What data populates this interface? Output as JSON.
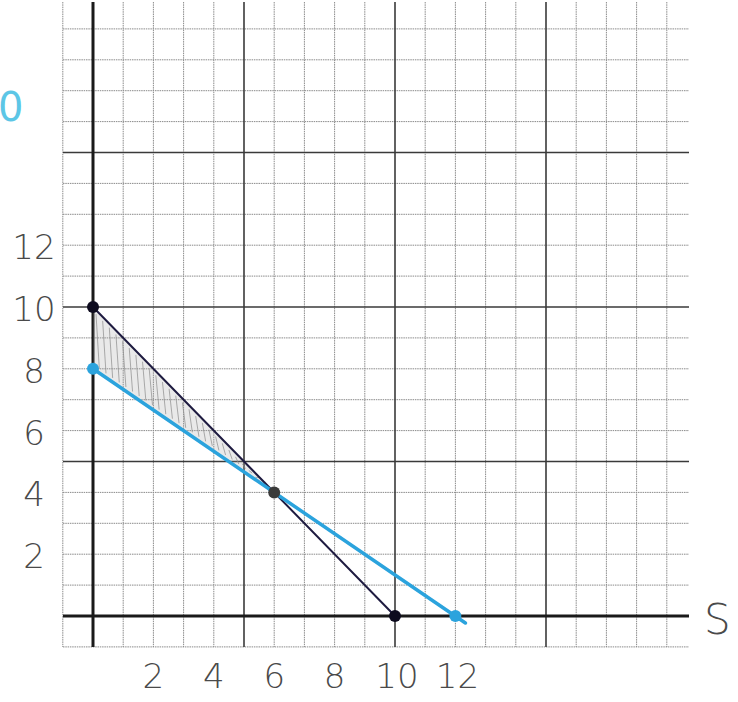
{
  "chart_data": {
    "type": "line",
    "title": "",
    "xlabel": "S",
    "ylabel": "",
    "partial_label_top_left": "0",
    "xlim": [
      -1,
      20
    ],
    "ylim": [
      -1,
      19.5
    ],
    "grid": true,
    "grid_minor_step": 1,
    "grid_major_step": 5,
    "x_tick_labels": [
      "2",
      "4",
      "6",
      "8",
      "10",
      "12"
    ],
    "x_tick_values": [
      2,
      4,
      6,
      8,
      10,
      12
    ],
    "y_tick_labels": [
      "2",
      "4",
      "6",
      "8",
      "10",
      "12"
    ],
    "y_tick_values": [
      2,
      4,
      6,
      8,
      10,
      12
    ],
    "series": [
      {
        "name": "dark-line",
        "color": "#1e1b40",
        "points": [
          [
            0,
            10
          ],
          [
            10,
            0
          ]
        ]
      },
      {
        "name": "blue-line",
        "color": "#2ba3dd",
        "points": [
          [
            0,
            8
          ],
          [
            12,
            0
          ]
        ]
      }
    ],
    "marked_points": [
      {
        "x": 0,
        "y": 10,
        "color": "#0d0b1e"
      },
      {
        "x": 10,
        "y": 0,
        "color": "#0d0b1e"
      },
      {
        "x": 0,
        "y": 8,
        "color": "#2ba3dd"
      },
      {
        "x": 12,
        "y": 0,
        "color": "#2ba3dd"
      },
      {
        "x": 6,
        "y": 4,
        "color": "#3a3a3a"
      }
    ],
    "shaded_region": {
      "description": "feasible region between the two lines",
      "color": "#9a9a9a",
      "polygon": [
        [
          0,
          10
        ],
        [
          6,
          4
        ],
        [
          0,
          8
        ]
      ]
    }
  },
  "layout": {
    "origin_px": [
      93,
      616
    ],
    "unit_px_x": 30.2,
    "unit_px_y": 30.9,
    "grid_left_px": 63,
    "grid_right_px": 689,
    "grid_top_px": 2,
    "grid_bottom_px": 647
  }
}
